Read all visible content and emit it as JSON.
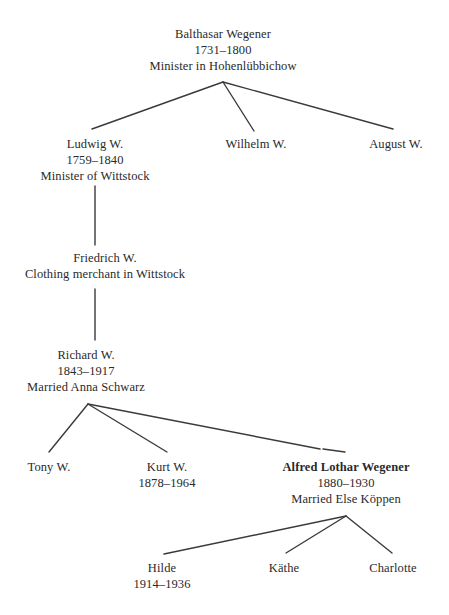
{
  "diagram": {
    "type": "family-tree",
    "nodes": {
      "balthasar": {
        "name": "Balthasar Wegener",
        "dates": "1731–1800",
        "note": "Minister in Hohenlübbichow"
      },
      "ludwig": {
        "name": "Ludwig W.",
        "dates": "1759–1840",
        "note": "Minister of Wittstock"
      },
      "wilhelm": {
        "name": "Wilhelm W."
      },
      "august": {
        "name": "August W."
      },
      "friedrich": {
        "name": "Friedrich W.",
        "note": "Clothing merchant in Wittstock"
      },
      "richard": {
        "name": "Richard W.",
        "dates": "1843–1917",
        "note": "Married Anna Schwarz"
      },
      "tony": {
        "name": "Tony W."
      },
      "kurt": {
        "name": "Kurt W.",
        "dates": "1878–1964"
      },
      "alfred": {
        "name": "Alfred Lothar Wegener",
        "dates": "1880–1930",
        "note": "Married Else Köppen",
        "emphasis": "bold"
      },
      "hilde": {
        "name": "Hilde",
        "dates": "1914–1936"
      },
      "kaethe": {
        "name": "Käthe"
      },
      "charlotte": {
        "name": "Charlotte"
      }
    },
    "edges": [
      {
        "from": "balthasar",
        "to": "ludwig"
      },
      {
        "from": "balthasar",
        "to": "wilhelm"
      },
      {
        "from": "balthasar",
        "to": "august"
      },
      {
        "from": "ludwig",
        "to": "friedrich"
      },
      {
        "from": "friedrich",
        "to": "richard"
      },
      {
        "from": "richard",
        "to": "tony"
      },
      {
        "from": "richard",
        "to": "kurt"
      },
      {
        "from": "richard",
        "to": "alfred"
      },
      {
        "from": "alfred",
        "to": "hilde"
      },
      {
        "from": "alfred",
        "to": "kaethe"
      },
      {
        "from": "alfred",
        "to": "charlotte"
      }
    ],
    "line_color": "#3a3a3a",
    "text_color": "#2a2a2a"
  }
}
